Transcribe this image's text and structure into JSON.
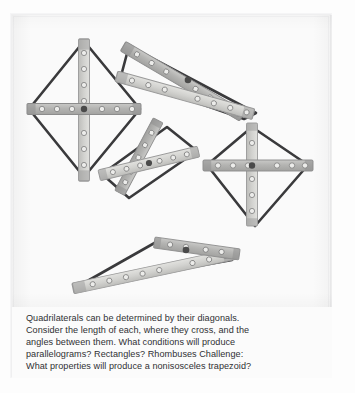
{
  "page": {
    "background": "#fdfdfd",
    "sheet_background": "#fafafa"
  },
  "figures": {
    "label": "Quadrilateral diagonal linkage figures",
    "colors": {
      "strip_fill": "#b9b9b9",
      "strip_fill_light": "#d4d4d2",
      "strip_edge": "#8e8e8e",
      "strip_end_cap": "#8a8a8a",
      "hole_fill": "#ededea",
      "hole_edge": "#7c7c7c",
      "pivot": "#4a4a4a",
      "outline": "#3a3a3c",
      "paper": "#fafafa"
    },
    "items": [
      {
        "name": "rhombus-figure",
        "shape": "rhombus",
        "description": "Rhombus with perpendicular diagonals crossing at midpoints"
      },
      {
        "name": "thin-parallelogram-figure",
        "shape": "parallelogram",
        "description": "Elongated parallelogram with oblique diagonals"
      },
      {
        "name": "rectangle-figure",
        "shape": "rectangle",
        "description": "Tilted rectangle with equal diagonals bisecting each other"
      },
      {
        "name": "kite-figure",
        "shape": "kite",
        "description": "Kite with one diagonal bisecting the other at right angles"
      },
      {
        "name": "trapezoid-figure",
        "shape": "trapezoid",
        "description": "Nonisosceles trapezoid with unequal diagonals"
      }
    ]
  },
  "caption": {
    "lines": [
      "Quadrilaterals can be determined by their diagonals.",
      "Consider the length of each, where they cross, and the",
      "angles between them. What conditions will produce",
      "parallelograms? Rectangles? Rhombuses Challenge:",
      "What properties will produce a nonisosceles trapezoid?"
    ]
  }
}
